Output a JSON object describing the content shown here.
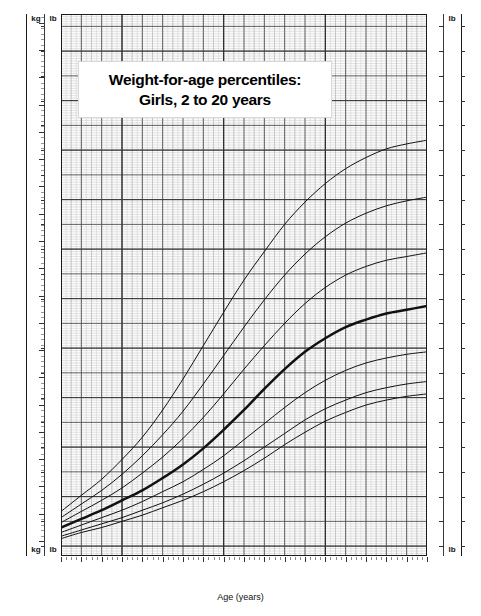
{
  "chart_data": {
    "type": "line",
    "title_line1": "Weight-for-age percentiles:",
    "title_line2": "Girls, 2 to 20 years",
    "xlabel": "Age (years)",
    "ylabel_left_primary": "kg",
    "ylabel_left_secondary": "lb",
    "ylabel_right_primary": "lb",
    "x": [
      2,
      3,
      4,
      5,
      6,
      7,
      8,
      9,
      10,
      11,
      12,
      13,
      14,
      15,
      16,
      17,
      18,
      19,
      20
    ],
    "xlim": [
      2,
      20
    ],
    "xticks": [
      2,
      3,
      4,
      5,
      6,
      7,
      8,
      9,
      10,
      11,
      12,
      13,
      14,
      15,
      16,
      17,
      18,
      19,
      20
    ],
    "ylim_lb": [
      16,
      235
    ],
    "yticks_lb": [
      20,
      30,
      40,
      50,
      60,
      70,
      80,
      90,
      100,
      110,
      120,
      130,
      140,
      150,
      160,
      170,
      180,
      190,
      200,
      210,
      220,
      230
    ],
    "yticks_kg": [
      10,
      15,
      20,
      25,
      30,
      35,
      40,
      45,
      50,
      55,
      60,
      65,
      70,
      75,
      80,
      85,
      90,
      95,
      100,
      105
    ],
    "grid": true,
    "legend_position": "right-inline",
    "series": [
      {
        "name": "95th",
        "label": "95th",
        "values_lb": [
          34.0,
          40.5,
          47.0,
          55.0,
          64.0,
          75.0,
          87.5,
          101.0,
          114.5,
          127.5,
          139.0,
          150.0,
          159.0,
          166.5,
          172.5,
          177.0,
          180.5,
          182.5,
          184.0
        ]
      },
      {
        "name": "90th",
        "label": "90th",
        "values_lb": [
          31.5,
          37.0,
          42.5,
          49.0,
          56.5,
          65.0,
          74.5,
          85.5,
          97.0,
          108.5,
          119.5,
          129.5,
          138.0,
          145.0,
          150.5,
          154.5,
          157.5,
          159.5,
          161.0
        ]
      },
      {
        "name": "75th",
        "label": "75th",
        "values_lb": [
          29.5,
          34.0,
          38.5,
          43.5,
          49.5,
          56.0,
          63.5,
          72.0,
          81.5,
          91.5,
          101.0,
          110.0,
          118.0,
          124.5,
          129.5,
          133.0,
          135.5,
          137.0,
          138.5
        ]
      },
      {
        "name": "50th",
        "label": "50th",
        "values_lb": [
          27.5,
          31.0,
          34.5,
          38.5,
          42.5,
          47.5,
          53.0,
          59.5,
          67.0,
          75.0,
          83.5,
          91.5,
          98.5,
          104.0,
          108.5,
          111.5,
          114.0,
          115.5,
          117.0
        ]
      },
      {
        "name": "25th",
        "label": "25th",
        "values_lb": [
          25.5,
          28.5,
          31.5,
          34.5,
          38.0,
          42.0,
          46.0,
          51.0,
          56.5,
          63.0,
          69.5,
          76.0,
          82.0,
          87.0,
          91.0,
          94.0,
          96.0,
          97.5,
          98.5
        ]
      },
      {
        "name": "10th",
        "label": "10th",
        "values_lb": [
          24.0,
          26.5,
          29.0,
          31.5,
          34.5,
          37.5,
          41.0,
          45.0,
          49.5,
          54.5,
          60.0,
          65.5,
          71.0,
          75.5,
          79.0,
          82.0,
          84.0,
          85.5,
          86.5
        ]
      },
      {
        "name": "5th",
        "label": "5th",
        "values_lb": [
          23.0,
          25.5,
          27.5,
          30.0,
          32.5,
          35.5,
          38.5,
          42.0,
          46.0,
          50.5,
          55.5,
          61.0,
          66.0,
          70.5,
          74.0,
          77.0,
          79.0,
          80.5,
          81.5
        ]
      }
    ]
  },
  "axes": {
    "left_kg_caption_top": "kg",
    "left_lb_caption_top": "lb",
    "left_kg_caption_bottom": "kg",
    "left_lb_caption_bottom": "lb",
    "right_lb_caption_top": "lb",
    "right_lb_caption_bottom": "lb"
  }
}
